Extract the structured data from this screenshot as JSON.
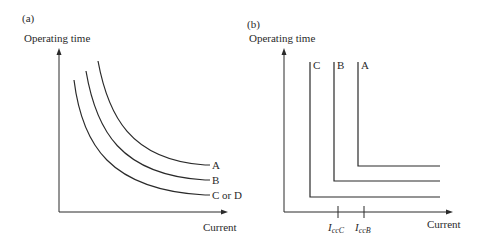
{
  "panels": [
    {
      "id": "a",
      "label": "(a)",
      "ylabel": "Operating time",
      "xlabel": "Current",
      "curves": [
        {
          "name": "A",
          "label": "A"
        },
        {
          "name": "B",
          "label": "B"
        },
        {
          "name": "C or D",
          "label": "C or D"
        }
      ]
    },
    {
      "id": "b",
      "label": "(b)",
      "ylabel": "Operating time",
      "xlabel": "Current",
      "curves": [
        {
          "name": "C",
          "label": "C"
        },
        {
          "name": "B",
          "label": "B"
        },
        {
          "name": "A",
          "label": "A"
        }
      ],
      "ticks": [
        {
          "main": "I",
          "sub": "ccC"
        },
        {
          "main": "I",
          "sub": "ccB"
        }
      ]
    }
  ],
  "colors": {
    "line": "#2a2a2a",
    "background": "#ffffff"
  }
}
